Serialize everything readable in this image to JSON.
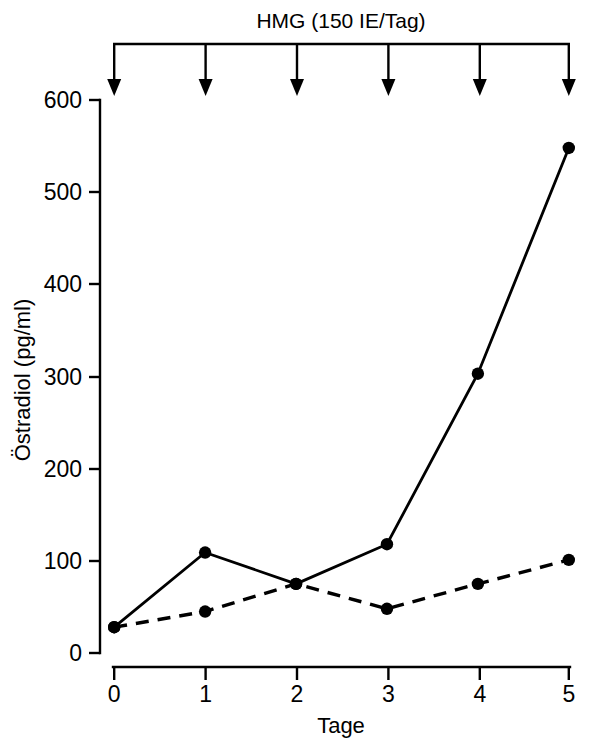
{
  "chart_data": {
    "type": "line",
    "title": "",
    "xlabel": "Tage",
    "ylabel": "Östradiol (pg/ml)",
    "x": [
      0,
      1,
      2,
      3,
      4,
      5
    ],
    "xticklabels": [
      "0",
      "1",
      "2",
      "3",
      "4",
      "5"
    ],
    "yticks": [
      0,
      100,
      200,
      300,
      400,
      500,
      600
    ],
    "yticklabels": [
      "0",
      "100",
      "200",
      "300",
      "400",
      "500",
      "600"
    ],
    "xlim": [
      0,
      5
    ],
    "ylim": [
      0,
      600
    ],
    "grid": false,
    "legend": "none",
    "series": [
      {
        "name": "solid",
        "style": "solid",
        "marker": "filled-circle",
        "values": [
          28,
          109,
          75,
          118,
          303,
          548
        ]
      },
      {
        "name": "dashed",
        "style": "dashed",
        "marker": "filled-circle",
        "values": [
          28,
          45,
          75,
          48,
          75,
          101
        ]
      }
    ],
    "annotations": {
      "treatment_label": "HMG (150 IE/Tag)",
      "arrow_days": [
        0,
        1,
        2,
        3,
        4,
        5
      ],
      "arrow_count": 6
    }
  },
  "colors": {
    "ink": "#000000",
    "background": "#ffffff"
  }
}
